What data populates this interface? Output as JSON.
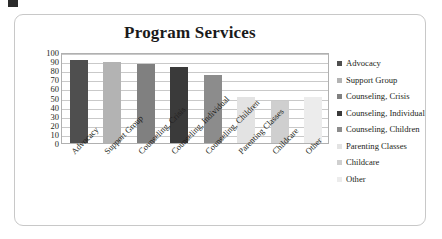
{
  "panel": {
    "name": "chart-panel"
  },
  "chart_data": {
    "type": "bar",
    "title": "Program Services",
    "xlabel": "",
    "ylabel": "",
    "ylim": [
      0,
      100
    ],
    "yticks": [
      100,
      90,
      80,
      70,
      60,
      50,
      40,
      30,
      20,
      10,
      0
    ],
    "grid": true,
    "legend_position": "right",
    "categories": [
      "Advocacy",
      "Support Group",
      "Counseling, Crisis",
      "Counseling, Individual",
      "Counseling, Children",
      "Parenting Classes",
      "Childcare",
      "Other"
    ],
    "values": [
      91,
      89,
      87,
      83,
      75,
      51,
      46,
      51
    ],
    "colors": [
      "#4f4f4f",
      "#b3b3b3",
      "#808080",
      "#3a3a3a",
      "#8c8c8c",
      "#e3e3e3",
      "#cfcfcf",
      "#ececec"
    ],
    "legend": [
      {
        "label": "Advocacy",
        "color": "#4f4f4f"
      },
      {
        "label": "Support Group",
        "color": "#b3b3b3"
      },
      {
        "label": "Counseling, Crisis",
        "color": "#808080"
      },
      {
        "label": "Counseling, Individual",
        "color": "#3a3a3a"
      },
      {
        "label": "Counseling, Children",
        "color": "#8c8c8c"
      },
      {
        "label": "Parenting Classes",
        "color": "#e3e3e3"
      },
      {
        "label": "Childcare",
        "color": "#cfcfcf"
      },
      {
        "label": "Other",
        "color": "#ececec"
      }
    ]
  }
}
